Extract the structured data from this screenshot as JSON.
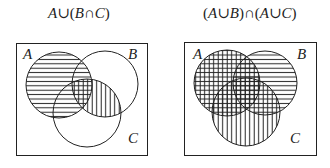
{
  "diagrams": [
    {
      "title": "A∪(B∩C)",
      "title_parts": [
        "A",
        "∪(",
        "B",
        "∩",
        "C",
        ")"
      ],
      "sets": [
        {
          "label": "A",
          "cx": 59,
          "cy": 85,
          "r": 33,
          "hatch": "horizontal"
        },
        {
          "label": "B",
          "cx": 105,
          "cy": 84,
          "r": 33,
          "hatch": "none"
        },
        {
          "label": "C",
          "cx": 87,
          "cy": 113,
          "r": 34,
          "hatch": "none"
        }
      ],
      "extra_hatch": {
        "region": "B∩C",
        "hatch": "vertical"
      },
      "universe_box": {
        "x": 16,
        "y": 43,
        "w": 131,
        "h": 112
      }
    },
    {
      "title": "(A∪B)∩(A∪C)",
      "title_parts": [
        "(",
        "A",
        "∪",
        "B",
        ")∩(",
        "A",
        "∪",
        "C",
        ")"
      ],
      "sets": [
        {
          "label": "A",
          "cx": 227,
          "cy": 83,
          "r": 33,
          "hatch": "cross"
        },
        {
          "label": "B",
          "cx": 265,
          "cy": 83,
          "r": 32,
          "hatch": "horizontal"
        },
        {
          "label": "C",
          "cx": 246,
          "cy": 112,
          "r": 34,
          "hatch": "vertical"
        }
      ],
      "hatch_meaning": {
        "horizontal": "A∪B",
        "vertical": "A∪C"
      },
      "universe_box": {
        "x": 184,
        "y": 42,
        "w": 132,
        "h": 113
      }
    }
  ],
  "labels": {
    "left": {
      "A": "A",
      "B": "B",
      "C": "C"
    },
    "right": {
      "A": "A",
      "B": "B",
      "C": "C"
    }
  },
  "colors": {
    "stroke": "#222222",
    "background": "#ffffff"
  }
}
